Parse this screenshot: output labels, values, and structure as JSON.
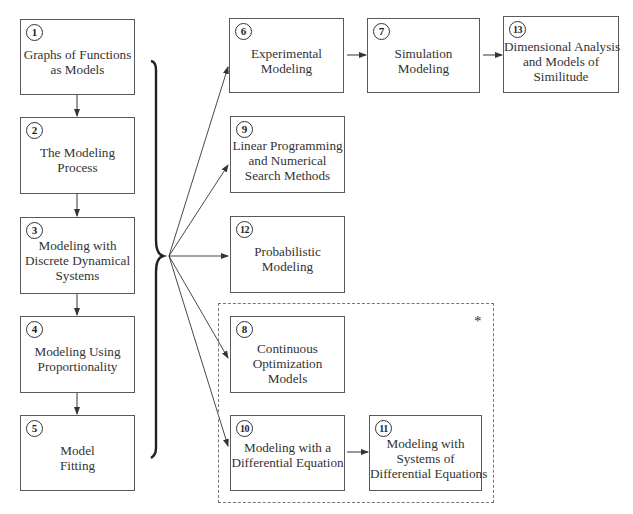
{
  "diagram": {
    "type": "chapter-dependency-flowchart",
    "boxes": [
      {
        "id": "1",
        "number": "1",
        "lines": [
          "Graphs of Functions",
          "as Models"
        ]
      },
      {
        "id": "2",
        "number": "2",
        "lines": [
          "The Modeling",
          "Process"
        ]
      },
      {
        "id": "3",
        "number": "3",
        "lines": [
          "Modeling with",
          "Discrete Dynamical",
          "Systems"
        ]
      },
      {
        "id": "4",
        "number": "4",
        "lines": [
          "Modeling Using",
          "Proportionality"
        ]
      },
      {
        "id": "5",
        "number": "5",
        "lines": [
          "Model",
          "Fitting"
        ]
      },
      {
        "id": "6",
        "number": "6",
        "lines": [
          "Experimental",
          "Modeling"
        ]
      },
      {
        "id": "7",
        "number": "7",
        "lines": [
          "Simulation",
          "Modeling"
        ]
      },
      {
        "id": "13",
        "number": "13",
        "lines": [
          "Dimensional Analysis",
          "and Models of",
          "Similitude"
        ]
      },
      {
        "id": "9",
        "number": "9",
        "lines": [
          "Linear Programming",
          "and Numerical",
          "Search Methods"
        ]
      },
      {
        "id": "12",
        "number": "12",
        "lines": [
          "Probabilistic",
          "Modeling"
        ]
      },
      {
        "id": "8",
        "number": "8",
        "lines": [
          "Continuous",
          "Optimization",
          "Models"
        ]
      },
      {
        "id": "10",
        "number": "10",
        "lines": [
          "Modeling with a",
          "Differential Equation"
        ]
      },
      {
        "id": "11",
        "number": "11",
        "lines": [
          "Modeling with",
          "Systems of",
          "Differential Equations"
        ]
      }
    ],
    "edges": [
      {
        "from": "1",
        "to": "2"
      },
      {
        "from": "2",
        "to": "3"
      },
      {
        "from": "3",
        "to": "4"
      },
      {
        "from": "4",
        "to": "5"
      },
      {
        "from": "brace(1-5)",
        "to": "6"
      },
      {
        "from": "brace(1-5)",
        "to": "9"
      },
      {
        "from": "brace(1-5)",
        "to": "12"
      },
      {
        "from": "brace(1-5)",
        "to": "8"
      },
      {
        "from": "brace(1-5)",
        "to": "10"
      },
      {
        "from": "6",
        "to": "7"
      },
      {
        "from": "7",
        "to": "13"
      },
      {
        "from": "10",
        "to": "11"
      }
    ],
    "group": {
      "members": [
        "8",
        "10",
        "11"
      ],
      "style": "dashed",
      "marker": "*"
    }
  }
}
